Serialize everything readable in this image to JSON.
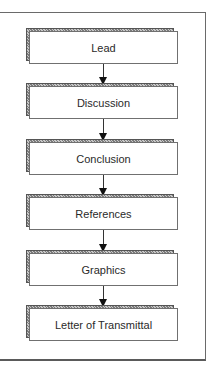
{
  "diagram": {
    "type": "flowchart",
    "direction": "top-to-bottom",
    "nodes": [
      {
        "label": "Lead"
      },
      {
        "label": "Discussion"
      },
      {
        "label": "Conclusion"
      },
      {
        "label": "References"
      },
      {
        "label": "Graphics"
      },
      {
        "label": "Letter of Transmittal"
      }
    ],
    "edges": [
      {
        "from": "Lead",
        "to": "Discussion"
      },
      {
        "from": "Discussion",
        "to": "Conclusion"
      },
      {
        "from": "Conclusion",
        "to": "References"
      },
      {
        "from": "References",
        "to": "Graphics"
      },
      {
        "from": "Graphics",
        "to": "Letter of Transmittal"
      }
    ]
  }
}
